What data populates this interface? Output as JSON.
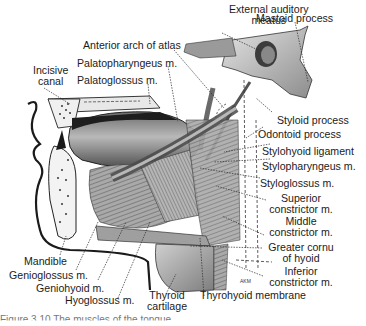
{
  "figure": {
    "caption": "Figure 3.10 The muscles of the tongue",
    "artist_initials": "AKM",
    "labels": {
      "external_auditory_meatus": [
        "External auditory",
        "meatus"
      ],
      "mastoid_process": "Mastoid process",
      "anterior_arch_of_atlas": "Anterior arch of atlas",
      "palatopharyngeus": "Palatopharyngeus m.",
      "incisive_canal": [
        "Incisive",
        "canal"
      ],
      "palatoglossus": "Palatoglossus m.",
      "styloid_process": "Styloid process",
      "odontoid_process": "Odontoid process",
      "stylohyoid_ligament": "Stylohyoid ligament",
      "stylopharyngeus": "Stylopharyngeus m.",
      "styloglossus": "Styloglossus m.",
      "superior_constrictor": [
        "Superior",
        "constrictor m."
      ],
      "middle_constrictor": [
        "Middle",
        "constrictor m."
      ],
      "greater_cornu_of_hyoid": [
        "Greater cornu",
        "of hyoid"
      ],
      "inferior_constrictor": [
        "Inferior",
        "constrictor m."
      ],
      "thyrohyoid_membrane": "Thyrohyoid membrane",
      "thyroid_cartilage": [
        "Thyroid",
        "cartilage"
      ],
      "hyoglossus": "Hyoglossus m.",
      "geniohyoid": "Geniohyoid m.",
      "genioglossus": "Genioglossus m.",
      "mandible": "Mandible"
    },
    "colors": {
      "ink": "#1b1b1b",
      "muscle_dark": "#3a3a3a",
      "muscle_mid": "#8a8a8a",
      "bone_light": "#d9d9d9",
      "paper": "#ffffff"
    }
  }
}
